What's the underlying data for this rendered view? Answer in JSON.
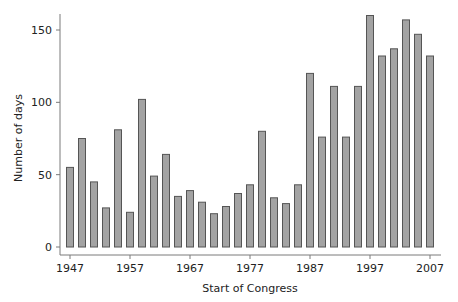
{
  "chart_data": {
    "type": "bar",
    "title": "",
    "xlabel": "Start of Congress",
    "ylabel": "Number of days",
    "ylim": [
      0,
      160
    ],
    "yticks": [
      0,
      50,
      100,
      150
    ],
    "xticks": [
      1947,
      1957,
      1967,
      1977,
      1987,
      1997,
      2007
    ],
    "grid": false,
    "legend": null,
    "categories": [
      1947,
      1949,
      1951,
      1953,
      1955,
      1957,
      1959,
      1961,
      1963,
      1965,
      1967,
      1969,
      1971,
      1973,
      1975,
      1977,
      1979,
      1981,
      1983,
      1985,
      1987,
      1989,
      1991,
      1993,
      1995,
      1997,
      1999,
      2001,
      2003,
      2005,
      2007
    ],
    "values": [
      55,
      75,
      45,
      27,
      81,
      24,
      102,
      49,
      64,
      35,
      39,
      31,
      23,
      28,
      37,
      43,
      80,
      34,
      30,
      43,
      120,
      76,
      111,
      76,
      111,
      160,
      132,
      137,
      157,
      147,
      132
    ],
    "colors": {
      "bar_fill": "#a3a3a3",
      "bar_stroke": "#555555",
      "axis": "#7a7a7a",
      "text": "#222222"
    }
  },
  "axes": {
    "x_title": "Start of Congress",
    "y_title": "Number of days",
    "x_tick_labels": [
      "1947",
      "1957",
      "1967",
      "1977",
      "1987",
      "1997",
      "2007"
    ],
    "y_tick_labels": [
      "0",
      "50",
      "100",
      "150"
    ]
  }
}
